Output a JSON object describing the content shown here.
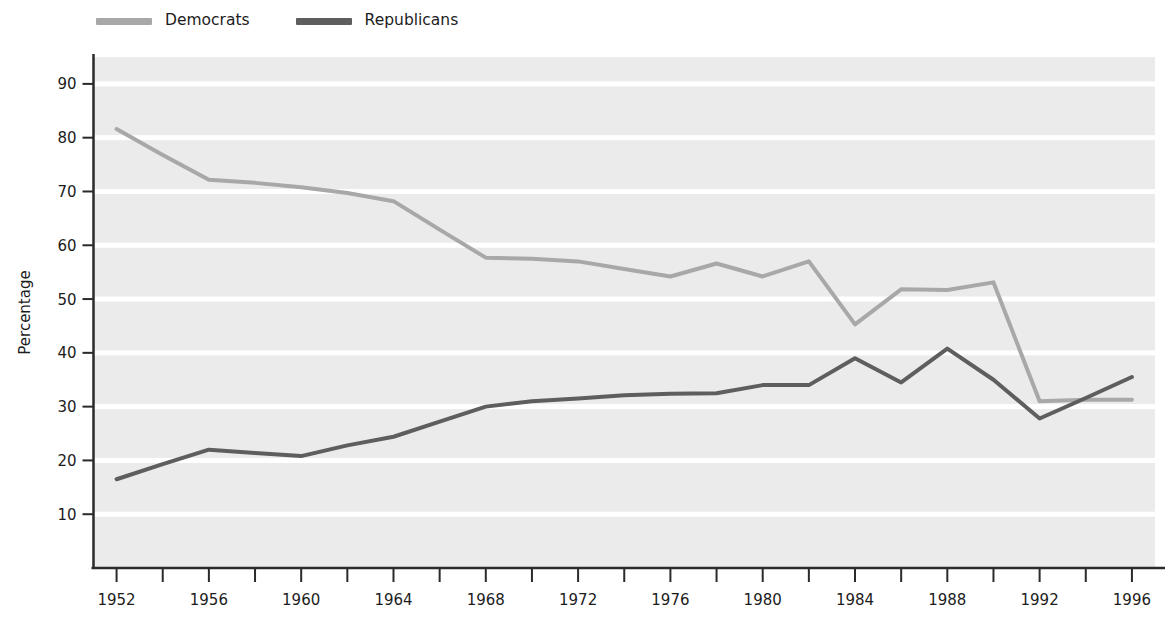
{
  "legend": {
    "position": "top-left-outside",
    "entries": [
      {
        "label": "Democrats",
        "color": "#a8a8a8"
      },
      {
        "label": "Republicans",
        "color": "#5e5e5e"
      }
    ]
  },
  "chart_data": {
    "type": "line",
    "title": "",
    "subtitle": "",
    "xlabel": "",
    "ylabel": "Percentage",
    "xlim": [
      1951,
      1997
    ],
    "ylim": [
      0,
      95
    ],
    "grid": "horizontal-white-bands",
    "plot_background": "#ebebeb",
    "xticks_major": [
      1952,
      1956,
      1960,
      1964,
      1968,
      1972,
      1976,
      1980,
      1984,
      1988,
      1992,
      1996
    ],
    "xticks_minor": [
      1954,
      1958,
      1962,
      1966,
      1970,
      1974,
      1978,
      1982,
      1986,
      1990,
      1994
    ],
    "xtick_labels": [
      "1952",
      "1956",
      "1960",
      "1964",
      "1968",
      "1972",
      "1976",
      "1980",
      "1984",
      "1988",
      "1992",
      "1996"
    ],
    "yticks": [
      10,
      20,
      30,
      40,
      50,
      60,
      70,
      80,
      90
    ],
    "ytick_labels": [
      "10",
      "20",
      "30",
      "40",
      "50",
      "60",
      "70",
      "80",
      "90"
    ],
    "x": [
      1952,
      1954,
      1956,
      1958,
      1960,
      1962,
      1964,
      1966,
      1968,
      1970,
      1972,
      1974,
      1976,
      1978,
      1980,
      1982,
      1984,
      1986,
      1988,
      1990,
      1992,
      1994,
      1996
    ],
    "series": [
      {
        "name": "Democrats",
        "color": "#a8a8a8",
        "line_width": 4,
        "values": [
          81.6,
          76.8,
          72.2,
          71.6,
          70.8,
          69.7,
          68.2,
          62.9,
          57.7,
          57.5,
          57.0,
          55.6,
          54.2,
          56.6,
          54.2,
          57.0,
          45.3,
          51.8,
          51.7,
          53.1,
          31.0,
          31.3,
          31.3
        ]
      },
      {
        "name": "Republicans",
        "color": "#5e5e5e",
        "line_width": 4,
        "values": [
          16.5,
          19.3,
          22.0,
          21.4,
          20.8,
          22.8,
          24.4,
          27.2,
          30.0,
          31.0,
          31.5,
          32.1,
          32.4,
          32.5,
          34.0,
          34.0,
          39.0,
          34.5,
          40.8,
          35.0,
          27.8,
          31.6,
          35.5
        ]
      }
    ]
  }
}
